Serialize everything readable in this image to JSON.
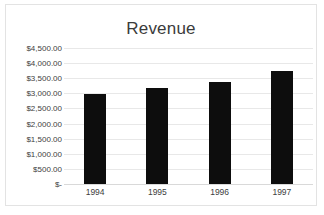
{
  "chart_data": {
    "type": "bar",
    "title": "Revenue",
    "xlabel": "",
    "ylabel": "",
    "categories": [
      "1994",
      "1995",
      "1996",
      "1997"
    ],
    "values": [
      2970,
      3170,
      3380,
      3750
    ],
    "series": [
      {
        "name": "Revenue",
        "values": [
          2970,
          3170,
          3380,
          3750
        ]
      }
    ],
    "ylim": [
      0,
      4500
    ],
    "y_tick_values": [
      4500,
      4000,
      3500,
      3000,
      2500,
      2000,
      1500,
      1000,
      500,
      0
    ],
    "y_tick_labels": [
      "$4,500.00",
      "$4,000.00",
      "$3,500.00",
      "$3,000.00",
      "$2,500.00",
      "$2,000.00",
      "$1,500.00",
      "$1,000.00",
      "$500.00",
      "$-"
    ],
    "grid": true,
    "legend": false,
    "legend_position": "none",
    "bar_color": "#0d0d0d",
    "gridline_color": "#e8e8e8",
    "title_color": "#3b3b3b",
    "label_color": "#404040",
    "border_color": "#e3e3e3",
    "background_color": "#ffffff"
  }
}
